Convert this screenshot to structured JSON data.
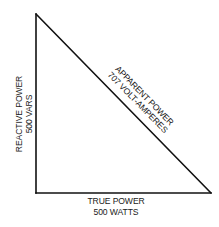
{
  "diagram": {
    "type": "power-triangle",
    "line_color": "#111111",
    "background": "#ffffff",
    "sides": {
      "reactive": {
        "line1": "REACTIVE POWER",
        "line2": "500 VARS"
      },
      "true": {
        "line1": "TRUE POWER",
        "line2": "500 WATTS"
      },
      "apparent": {
        "line1": "APPARENT POWER",
        "line2": "707 VOLT-AMPERES"
      }
    }
  }
}
